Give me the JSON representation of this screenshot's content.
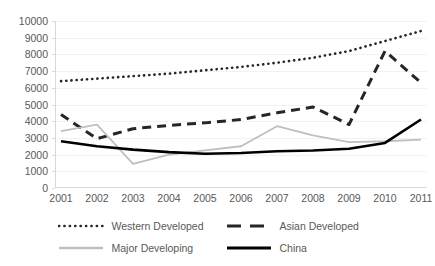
{
  "chart_data": {
    "type": "line",
    "title": "",
    "xlabel": "",
    "ylabel": "",
    "grid": true,
    "legend_position": "bottom",
    "categories": [
      "2001",
      "2002",
      "2003",
      "2004",
      "2005",
      "2006",
      "2007",
      "2008",
      "2009",
      "2010",
      "2011"
    ],
    "ylim": [
      0,
      10000
    ],
    "yticks": [
      0,
      1000,
      2000,
      3000,
      4000,
      5000,
      6000,
      7000,
      8000,
      9000,
      10000
    ],
    "ytick_labels": [
      "0",
      "1000",
      "2000",
      "3000",
      "4000",
      "5000",
      "6000",
      "7000",
      "8000",
      "9000",
      "10000"
    ],
    "series": [
      {
        "name": "Western Developed",
        "style": "dotted",
        "color": "#262626",
        "values": [
          6400,
          6550,
          6700,
          6850,
          7050,
          7250,
          7500,
          7800,
          8200,
          8800,
          9400
        ]
      },
      {
        "name": "Asian Developed",
        "style": "dashed",
        "color": "#262626",
        "values": [
          4400,
          2950,
          3550,
          3750,
          3900,
          4100,
          4500,
          4850,
          3800,
          8200,
          6300
        ]
      },
      {
        "name": "Major Developing",
        "style": "solid",
        "color": "#bfbfbf",
        "values": [
          3400,
          3800,
          1450,
          2000,
          2250,
          2500,
          3700,
          3150,
          2750,
          2800,
          2900
        ]
      },
      {
        "name": "China",
        "style": "solid-bold",
        "color": "#000000",
        "values": [
          2800,
          2500,
          2300,
          2150,
          2050,
          2100,
          2200,
          2250,
          2350,
          2700,
          4100
        ]
      }
    ]
  },
  "legend": {
    "items": [
      {
        "label": "Western Developed",
        "style": "dotted"
      },
      {
        "label": "Asian Developed",
        "style": "dashed"
      },
      {
        "label": "Major Developing",
        "style": "solid-gray"
      },
      {
        "label": "China",
        "style": "solid-bold"
      }
    ]
  }
}
